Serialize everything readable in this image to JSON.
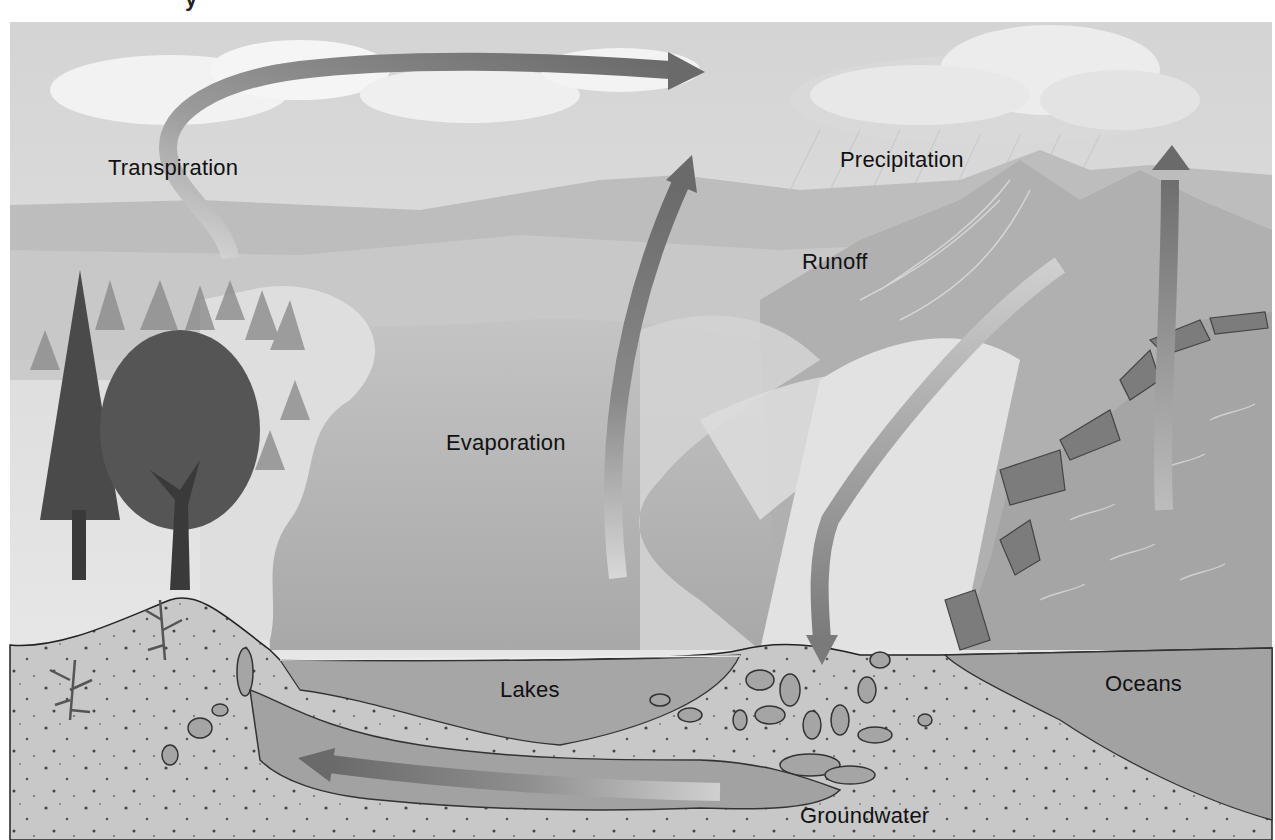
{
  "figure": {
    "title_partial": "y",
    "colors": {
      "background": "#ffffff",
      "sky": "#e2e2e2",
      "cloud": "#f4f4f4",
      "hills": "#b8b8b8",
      "lake": "#a9a9a9",
      "ocean": "#9e9e9e",
      "soil": "#c6c6c6",
      "arrow_dark": "#6e6e6e",
      "arrow_light": "#d6d6d6",
      "label_text": "#111111"
    }
  },
  "labels": {
    "transpiration": "Transpiration",
    "precipitation": "Precipitation",
    "runoff": "Runoff",
    "evaporation": "Evaporation",
    "lakes": "Lakes",
    "oceans": "Oceans",
    "groundwater": "Groundwater"
  },
  "arrows": [
    {
      "name": "transpiration-arrow",
      "direction": "up-then-right",
      "from": "trees",
      "to": "clouds"
    },
    {
      "name": "evaporation-arrow",
      "direction": "up",
      "from": "lakes",
      "to": "atmosphere"
    },
    {
      "name": "runoff-arrow",
      "direction": "down",
      "from": "mountains",
      "to": "ground"
    },
    {
      "name": "ocean-evaporation-arrow",
      "direction": "up",
      "from": "oceans",
      "to": "clouds"
    },
    {
      "name": "groundwater-arrow",
      "direction": "left",
      "from": "ground",
      "to": "hillside"
    }
  ]
}
